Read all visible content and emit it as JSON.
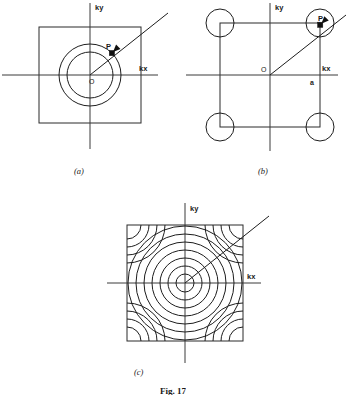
{
  "figure": {
    "caption": "Fig. 17",
    "caption_visible_fragment": "Fig. 17",
    "background_color": "#ffffff",
    "ink_color": "#1a1a1a"
  },
  "panels": [
    {
      "id": "a",
      "caption": "(a)",
      "axis_labels": {
        "x": "kx",
        "y": "ky"
      },
      "origin_label": "O",
      "point_label": "P",
      "lattice_label": "",
      "zone": {
        "type": "square",
        "half_width": 51,
        "half_height": 48
      },
      "fermi_circles": [
        23,
        31
      ],
      "corner_arcs": [],
      "k_vector": {
        "angle_deg": 45,
        "from_origin": true,
        "tip_radius": 31
      },
      "description": "Free electron Fermi circle entirely inside the first Brillouin zone"
    },
    {
      "id": "b",
      "caption": "(b)",
      "axis_labels": {
        "x": "kx",
        "y": "ky"
      },
      "origin_label": "O",
      "point_label": "P",
      "lattice_label": "a",
      "zone": {
        "type": "square",
        "half_width": 50,
        "half_height": 52
      },
      "fermi_circles": [],
      "corner_arcs": [
        14
      ],
      "k_vector": {
        "angle_deg": 45,
        "from_origin": true,
        "tip_radius": 71
      },
      "description": "Fermi surface touching and overlapping the zone corners"
    },
    {
      "id": "c",
      "caption": "(c)",
      "axis_labels": {
        "x": "kx",
        "y": "ky"
      },
      "origin_label": "",
      "point_label": "",
      "lattice_label": "",
      "zone": {
        "type": "square",
        "half_width": 58,
        "half_height": 58
      },
      "fermi_circles": [
        9,
        17,
        25,
        33,
        41,
        49,
        57
      ],
      "corner_arcs": [
        14,
        22,
        30,
        38
      ],
      "k_vector": {
        "angle_deg": 45,
        "from_origin": true,
        "tip_radius": 82
      },
      "description": "Family of constant energy contours filling the zone with corner pockets"
    }
  ],
  "chart_data": {
    "type": "scatter",
    "title": "Fig. 17",
    "xlabel": "kx",
    "ylabel": "ky",
    "subplots": [
      {
        "label": "(a)",
        "series": [
          {
            "name": "zone boundary",
            "shape": "square",
            "half_width": 51,
            "half_height": 48
          },
          {
            "name": "inner contour",
            "shape": "circle",
            "radius": 23
          },
          {
            "name": "outer contour",
            "shape": "circle",
            "radius": 31
          },
          {
            "name": "k vector",
            "shape": "ray",
            "angle_deg": 45,
            "length": 31
          },
          {
            "name": "point P",
            "shape": "marker",
            "x": 22,
            "y": 22
          }
        ]
      },
      {
        "label": "(b)",
        "series": [
          {
            "name": "zone boundary",
            "shape": "square",
            "half_width": 50,
            "half_height": 52
          },
          {
            "name": "corner arcs",
            "shape": "arc",
            "radius": 14,
            "count": 4
          },
          {
            "name": "k vector",
            "shape": "ray",
            "angle_deg": 45,
            "length": 71
          },
          {
            "name": "point P",
            "shape": "marker",
            "x": 50,
            "y": 50
          }
        ]
      },
      {
        "label": "(c)",
        "series": [
          {
            "name": "zone boundary",
            "shape": "square",
            "half_width": 58,
            "half_height": 58
          },
          {
            "name": "contour set",
            "shape": "circle",
            "radii": [
              9,
              17,
              25,
              33,
              41,
              49,
              57
            ]
          },
          {
            "name": "corner arc set",
            "shape": "arc",
            "radii": [
              14,
              22,
              30,
              38
            ],
            "count": 4
          },
          {
            "name": "k vector",
            "shape": "ray",
            "angle_deg": 45,
            "length": 82
          }
        ]
      }
    ]
  }
}
